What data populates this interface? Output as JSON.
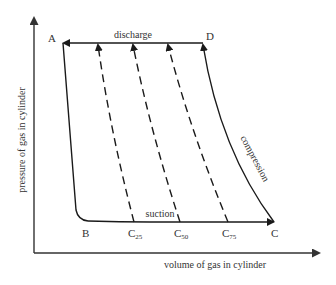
{
  "diagram": {
    "type": "pressure-volume indicator diagram",
    "axes": {
      "x_label": "volume of gas in cylinder",
      "y_label": "pressure of gas in cylinder"
    },
    "points": {
      "A": "A",
      "B": "B",
      "C": "C",
      "D": "D",
      "C25": {
        "main": "C",
        "sub": "25"
      },
      "C50": {
        "main": "C",
        "sub": "50"
      },
      "C75": {
        "main": "C",
        "sub": "75"
      }
    },
    "process_labels": {
      "discharge": "discharge",
      "suction": "suction",
      "compression": "compression"
    },
    "colors": {
      "line": "#1a1a1a",
      "axis": "#333333",
      "text": "#333333"
    }
  }
}
